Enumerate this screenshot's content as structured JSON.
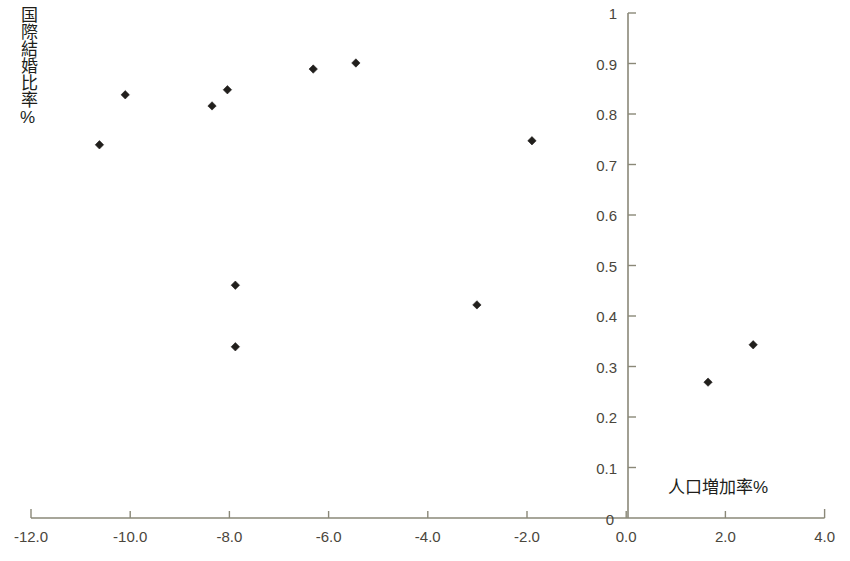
{
  "chart_data": {
    "type": "scatter",
    "title": "",
    "xlabel": "人口増加率%",
    "ylabel": "国際結婚比率%",
    "xlim": [
      -12.0,
      4.0
    ],
    "ylim": [
      0,
      1
    ],
    "grid": false,
    "legend": null,
    "x_ticks": [
      "-12.0",
      "-10.0",
      "-8.0",
      "-6.0",
      "-4.0",
      "-2.0",
      "0.0",
      "2.0",
      "4.0"
    ],
    "x_tick_values": [
      -12.0,
      -10.0,
      -8.0,
      -6.0,
      -4.0,
      -2.0,
      0.0,
      2.0,
      4.0
    ],
    "y_ticks": [
      "0",
      "0.1",
      "0.2",
      "0.3",
      "0.4",
      "0.5",
      "0.6",
      "0.7",
      "0.8",
      "0.9",
      "1"
    ],
    "y_tick_values": [
      0,
      0.1,
      0.2,
      0.3,
      0.4,
      0.5,
      0.6,
      0.7,
      0.8,
      0.9,
      1
    ],
    "marker": "diamond",
    "marker_color": "#211f1c",
    "axis_color": "#8a8878",
    "points": [
      {
        "x": -10.62,
        "y": 0.739
      },
      {
        "x": -10.1,
        "y": 0.838
      },
      {
        "x": -8.35,
        "y": 0.816
      },
      {
        "x": -8.04,
        "y": 0.848
      },
      {
        "x": -7.88,
        "y": 0.461
      },
      {
        "x": -7.88,
        "y": 0.339
      },
      {
        "x": -6.31,
        "y": 0.889
      },
      {
        "x": -5.45,
        "y": 0.901
      },
      {
        "x": -3.01,
        "y": 0.422
      },
      {
        "x": -1.9,
        "y": 0.747
      },
      {
        "x": 1.65,
        "y": 0.269
      },
      {
        "x": 2.56,
        "y": 0.343
      }
    ]
  },
  "axes": {
    "y_axis_title": "国際結婚比率%",
    "x_axis_title": "人口増加率%"
  }
}
